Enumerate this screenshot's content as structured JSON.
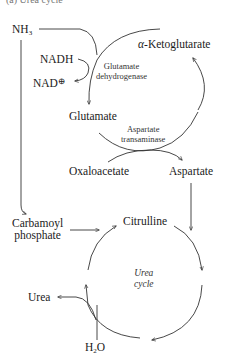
{
  "caption": "(a) Urea cycle",
  "nodes": {
    "nh3": {
      "main": "NH",
      "sub": "3"
    },
    "nadh": "NADH",
    "nad": {
      "main": "NAD",
      "sup": "⊕"
    },
    "alpha_kg": {
      "greek": "α",
      "rest": "-Ketoglutarate"
    },
    "glutamate": "Glutamate",
    "oxaloacetate": "Oxaloacetate",
    "aspartate": "Aspartate",
    "carbamoyl_phosphate_1": "Carbamoyl",
    "carbamoyl_phosphate_2": "phosphate",
    "citrulline": "Citrulline",
    "urea": "Urea",
    "water": {
      "h": "H",
      "sub": "2",
      "o": "O"
    }
  },
  "enzymes": {
    "glutamate_dehydrogenase_1": "Glutamate",
    "glutamate_dehydrogenase_2": "dehydrogenase",
    "aspartate_transaminase_1": "Aspartate",
    "aspartate_transaminase_2": "transaminase"
  },
  "cycle_label": {
    "line1": "Urea",
    "line2": "cycle"
  },
  "colors": {
    "line": "#333333",
    "text": "#1a1a1a"
  }
}
